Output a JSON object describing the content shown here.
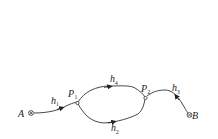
{
  "diagram": {
    "nodes": {
      "A": {
        "label": "A",
        "symbol": "⊗"
      },
      "B": {
        "label": "B",
        "symbol": "⊗"
      },
      "P1": {
        "label": "P",
        "sub": "1"
      },
      "P2": {
        "label": "P",
        "sub": "2"
      }
    },
    "edges": {
      "h1": {
        "label": "h",
        "sub": "1",
        "from": "A",
        "to": "P1"
      },
      "h4": {
        "label": "h",
        "sub": "4",
        "from": "P1",
        "to": "P2",
        "path": "upper"
      },
      "h2": {
        "label": "h",
        "sub": "2",
        "from": "P1",
        "to": "P2",
        "path": "lower"
      },
      "h3": {
        "label": "h",
        "sub": "3",
        "from": "B",
        "to": "P2"
      }
    },
    "colors": {
      "stroke": "#333333",
      "background": "#ffffff"
    }
  }
}
